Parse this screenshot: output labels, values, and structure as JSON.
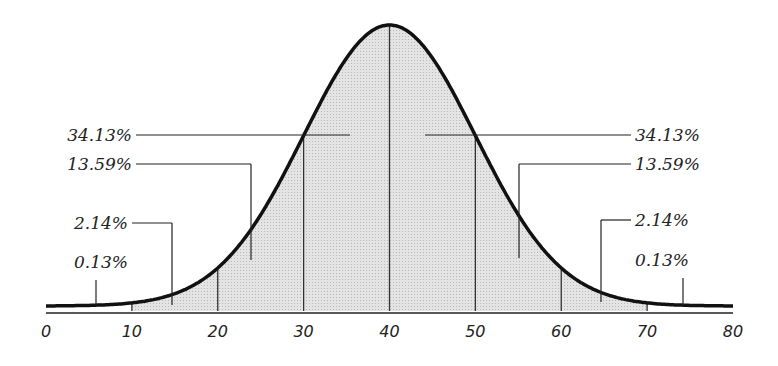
{
  "chart_data": {
    "type": "area",
    "title": "",
    "xlabel": "",
    "ylabel": "",
    "xlim": [
      0,
      80
    ],
    "x_ticks": [
      "0",
      "10",
      "20",
      "30",
      "40",
      "50",
      "60",
      "70",
      "80"
    ],
    "mean": 40,
    "std_dev": 10,
    "grid": false,
    "bands": [
      {
        "range": [
          10,
          20
        ],
        "percent": "2.14%",
        "side": "left"
      },
      {
        "range": [
          20,
          30
        ],
        "percent": "13.59%",
        "side": "left"
      },
      {
        "range": [
          30,
          40
        ],
        "percent": "34.13%",
        "side": "left"
      },
      {
        "range": [
          40,
          50
        ],
        "percent": "34.13%",
        "side": "right"
      },
      {
        "range": [
          50,
          60
        ],
        "percent": "13.59%",
        "side": "right"
      },
      {
        "range": [
          60,
          70
        ],
        "percent": "2.14%",
        "side": "right"
      },
      {
        "range": [
          0,
          10
        ],
        "percent": "0.13%",
        "side": "left"
      },
      {
        "range": [
          70,
          80
        ],
        "percent": "0.13%",
        "side": "right"
      }
    ],
    "labels": {
      "left": [
        "34.13%",
        "13.59%",
        "2.14%",
        "0.13%"
      ],
      "right": [
        "34.13%",
        "13.59%",
        "2.14%",
        "0.13%"
      ]
    },
    "shaded_range": [
      10,
      70
    ]
  }
}
